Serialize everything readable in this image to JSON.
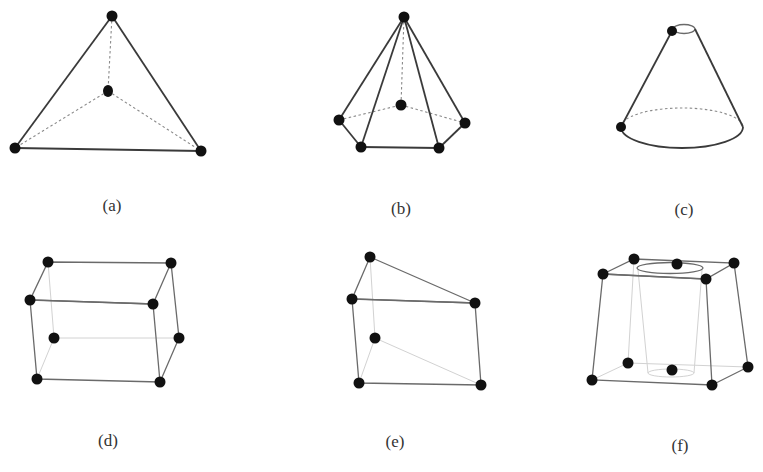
{
  "figure": {
    "panels": [
      {
        "id": "a",
        "label": "(a)",
        "shape": "tetrahedron",
        "node_count": 4
      },
      {
        "id": "b",
        "label": "(b)",
        "shape": "pentagonal-pyramid",
        "node_count": 6
      },
      {
        "id": "c",
        "label": "(c)",
        "shape": "cone",
        "node_count": 2
      },
      {
        "id": "d",
        "label": "(d)",
        "shape": "hexahedron",
        "node_count": 8
      },
      {
        "id": "e",
        "label": "(e)",
        "shape": "wedge",
        "node_count": 6
      },
      {
        "id": "f",
        "label": "(f)",
        "shape": "hexahedron-with-cylindrical-hole",
        "node_count": 10
      }
    ]
  }
}
